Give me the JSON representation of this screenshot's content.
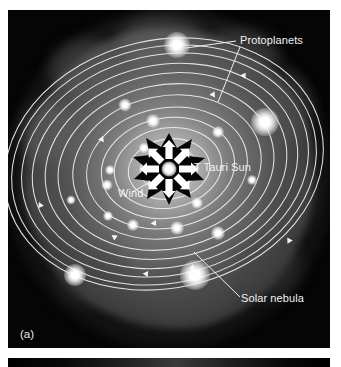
{
  "figure": {
    "panel_label": "(a)",
    "background_color": "#ffffff"
  },
  "labels": [
    {
      "id": "protoplanets",
      "text": "Protoplanets",
      "color": "#f2f2f2"
    },
    {
      "id": "t-tauri-sun",
      "text": "T Tauri Sun",
      "color": "#f2f2f2"
    },
    {
      "id": "wind",
      "text": "Wind",
      "color": "#f2f2f2"
    },
    {
      "id": "solar-nebula",
      "text": "Solar nebula",
      "color": "#f2f2f2"
    }
  ],
  "colors": {
    "nebula_bright": "#c8c8c8",
    "nebula_mid": "#6e6e6e",
    "nebula_dark": "#1b1b1b",
    "orbit_line": "#f0f0f0",
    "star_core": "#ffffff",
    "star_burst": "#060606",
    "frame": "#050505",
    "page": "#ffffff"
  },
  "scene": {
    "type": "solar-nebula-diagram",
    "center": {
      "x": 161,
      "y": 159
    },
    "orbit_count": 13,
    "protoplanet_count": 17,
    "wind_arrow_count": 8
  }
}
